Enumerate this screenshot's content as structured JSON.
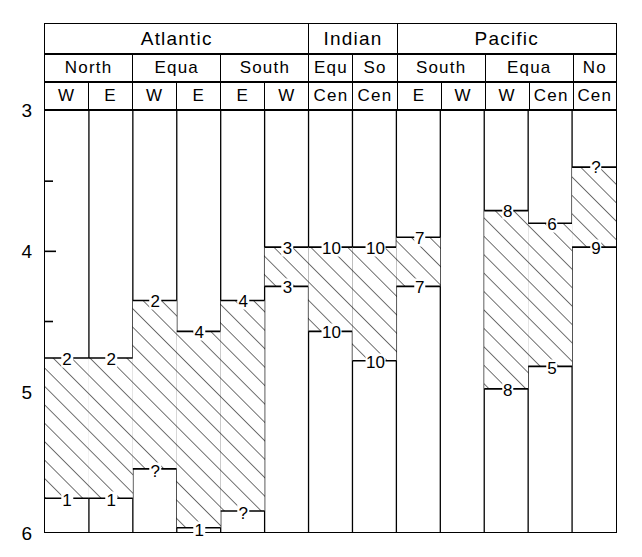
{
  "chart_data": {
    "type": "bar",
    "title": "",
    "xlabel": "",
    "ylabel": "",
    "ylim": [
      3,
      6
    ],
    "y_inverted": true,
    "y_ticks": [
      3,
      4,
      5,
      6
    ],
    "y_minor_ticks": [
      3.5,
      4.5,
      5.5
    ],
    "y_tick_labels": [
      "3",
      "4",
      "5",
      "6"
    ],
    "grid": false,
    "legend": "none",
    "orientation": "vertical-ranges",
    "hatch": "diagonal-45",
    "ocean_groups": [
      {
        "label": "Atlantic",
        "span": 6
      },
      {
        "label": "Indian",
        "span": 2
      },
      {
        "label": "Pacific",
        "span": 5
      }
    ],
    "region_groups": [
      {
        "label": "North",
        "span": 2
      },
      {
        "label": "Equa",
        "span": 2
      },
      {
        "label": "South",
        "span": 2
      },
      {
        "label": "Equ",
        "span": 1
      },
      {
        "label": "So",
        "span": 1
      },
      {
        "label": "South",
        "span": 2
      },
      {
        "label": "Equa",
        "span": 2
      },
      {
        "label": "No",
        "span": 1
      }
    ],
    "sectors": [
      "W",
      "E",
      "W",
      "E",
      "E",
      "W",
      "Cen",
      "Cen",
      "E",
      "W",
      "W",
      "Cen",
      "Cen"
    ],
    "categories": [
      "Atlantic North W",
      "Atlantic North E",
      "Atlantic Equa W",
      "Atlantic Equa E",
      "Atlantic South E",
      "Atlantic South W",
      "Indian Equ Cen",
      "Indian So Cen",
      "Indian South E",
      "Pacific South W",
      "Pacific Equa W",
      "Pacific Equa Cen",
      "Pacific No Cen"
    ],
    "bands": [
      {
        "column": 0,
        "top": 4.76,
        "bottom": 5.76,
        "top_label": "2",
        "bottom_label": "1"
      },
      {
        "column": 1,
        "top": 4.76,
        "bottom": 5.76,
        "top_label": "2",
        "bottom_label": "1"
      },
      {
        "column": 2,
        "top": 4.35,
        "bottom": 5.55,
        "top_label": "2",
        "bottom_label": "?"
      },
      {
        "column": 3,
        "top": 4.57,
        "bottom": 5.97,
        "top_label": "4",
        "bottom_label": "1"
      },
      {
        "column": 4,
        "top": 4.35,
        "bottom": 5.85,
        "top_label": "4",
        "bottom_label": "?"
      },
      {
        "column": 5,
        "top": 3.97,
        "bottom": 4.25,
        "top_label": "3",
        "bottom_label": "3"
      },
      {
        "column": 6,
        "top": 3.97,
        "bottom": 4.57,
        "top_label": "10",
        "bottom_label": "10"
      },
      {
        "column": 7,
        "top": 3.97,
        "bottom": 4.78,
        "top_label": "10",
        "bottom_label": "10"
      },
      {
        "column": 8,
        "top": 3.9,
        "bottom": 4.25,
        "top_label": "7",
        "bottom_label": "7"
      },
      {
        "column": 10,
        "top": 3.71,
        "bottom": 4.98,
        "top_label": "8",
        "bottom_label": "8"
      },
      {
        "column": 11,
        "top": 3.8,
        "bottom": 4.82,
        "top_label": "6",
        "bottom_label": "5"
      },
      {
        "column": 12,
        "top": 3.4,
        "bottom": 3.97,
        "top_label": "?",
        "bottom_label": "9"
      }
    ]
  }
}
